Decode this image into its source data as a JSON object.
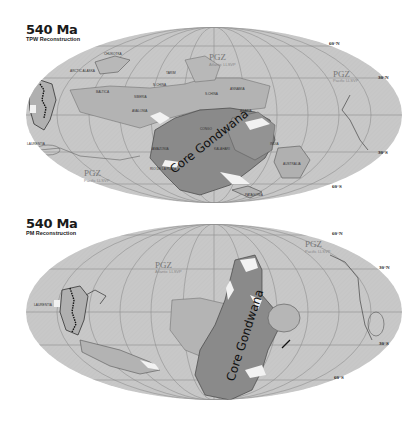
{
  "panels": [
    {
      "id": "top",
      "title": "540 Ma",
      "subtitle": "TPW Reconstruction",
      "core_label": "Core Gondwana",
      "pgz_labels": [
        {
          "label": "PGZ",
          "sub": "Atlantic LLSVP"
        },
        {
          "label": "PGZ",
          "sub": "Pacific LLSVP"
        },
        {
          "label": "PGZ",
          "sub": "Pacific LLSVP"
        }
      ],
      "lat_labels": [
        "60°N",
        "30°N",
        "30°S",
        "60°S"
      ],
      "continent_labels": [
        "LAURENTIA",
        "ARCTIC ALASKA",
        "CHUKOTKA",
        "BALTICA",
        "SIBERIA",
        "TARIM",
        "N.CHINA",
        "S.CHINA",
        "ANNAMIA",
        "AVALONIA",
        "AMAZONIA",
        "RIO DE LA PLATA",
        "PATAGONIA",
        "AUSTRALIA",
        "KALAHARI",
        "CONGO",
        "INDIA",
        "ARABIA"
      ]
    },
    {
      "id": "bottom",
      "title": "540 Ma",
      "subtitle": "PM Reconstruction",
      "core_label": "Core Gondwana",
      "pgz_labels": [
        {
          "label": "PGZ",
          "sub": "Atlantic LLSVP"
        },
        {
          "label": "PGZ",
          "sub": "Pacific LLSVP"
        }
      ],
      "lat_labels": [
        "60°N",
        "30°N",
        "30°S",
        "60°S"
      ],
      "continent_labels": [
        "LAURENTIA"
      ]
    }
  ],
  "colors": {
    "ocean": "#c8c8c8",
    "continent": "#a9a9a9",
    "gondwana": "#8a8a8a",
    "grid": "#8f8f8f",
    "outline": "#555555",
    "ice": "#f2f2f2"
  }
}
